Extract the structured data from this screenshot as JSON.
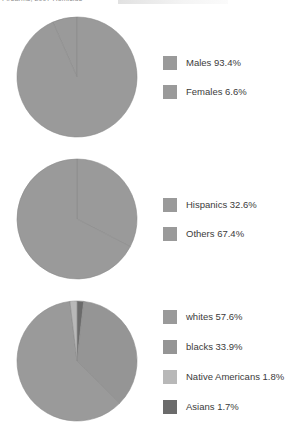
{
  "caption": {
    "text": "Firearms, 2007 Homicide",
    "visible_note": "clipped partial header line at top edge"
  },
  "palette": {
    "mid_gray": "#9a9a9a",
    "mid_gray_alt": "#959595",
    "light_gray": "#b8b8b8",
    "dark_gray": "#6b6b6b",
    "outline": "#8a8a8a",
    "text": "#3b3b3b",
    "background": "#ffffff"
  },
  "chart_data": [
    {
      "type": "pie",
      "name": "gender-breakdown",
      "title": "",
      "labels": [
        "Males",
        "Females"
      ],
      "values": [
        93.4,
        6.6
      ],
      "unit": "%",
      "colors": [
        "#9a9a9a",
        "#9a9a9a"
      ],
      "legend_position": "right",
      "legend": [
        {
          "label": "Males 93.4%",
          "swatch": "#9a9a9a",
          "value": 93.4,
          "name": "Males"
        },
        {
          "label": "Females 6.6%",
          "swatch": "#9a9a9a",
          "value": 6.6,
          "name": "Females"
        }
      ]
    },
    {
      "type": "pie",
      "name": "ethnicity-breakdown",
      "title": "",
      "labels": [
        "Hispanics",
        "Others"
      ],
      "values": [
        32.6,
        67.4
      ],
      "unit": "%",
      "colors": [
        "#9a9a9a",
        "#9a9a9a"
      ],
      "legend_position": "right",
      "legend": [
        {
          "label": "Hispanics 32.6%",
          "swatch": "#9a9a9a",
          "value": 32.6,
          "name": "Hispanics"
        },
        {
          "label": "Others 67.4%",
          "swatch": "#9a9a9a",
          "value": 67.4,
          "name": "Others"
        }
      ]
    },
    {
      "type": "pie",
      "name": "race-breakdown",
      "title": "",
      "labels": [
        "whites",
        "blacks",
        "Native Americans",
        "Asians"
      ],
      "values": [
        57.6,
        33.9,
        1.8,
        1.7
      ],
      "unit": "%",
      "colors": [
        "#9a9a9a",
        "#959595",
        "#b8b8b8",
        "#6b6b6b"
      ],
      "legend_position": "right",
      "legend": [
        {
          "label": "whites 57.6%",
          "swatch": "#9a9a9a",
          "value": 57.6,
          "name": "whites"
        },
        {
          "label": "blacks 33.9%",
          "swatch": "#959595",
          "value": 33.9,
          "name": "blacks"
        },
        {
          "label": "Native Americans 1.8%",
          "swatch": "#b8b8b8",
          "value": 1.8,
          "name": "Native Americans"
        },
        {
          "label": "Asians 1.7%",
          "swatch": "#6b6b6b",
          "value": 1.7,
          "name": "Asians"
        }
      ]
    }
  ]
}
